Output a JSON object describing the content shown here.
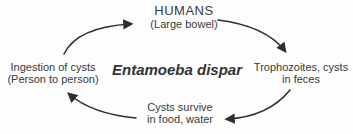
{
  "diagram": {
    "title": "Entamoeba dispar",
    "nodes": {
      "humans": {
        "line1": "HUMANS",
        "line2": "(Large bowel)"
      },
      "trophozoites": {
        "line1": "Trophozoites, cysts",
        "line2": "in feces"
      },
      "cysts_survive": {
        "line1": "Cysts survive",
        "line2": "in food, water"
      },
      "ingestion": {
        "line1": "Ingestion of cysts",
        "line2": "(Person to person)"
      }
    },
    "arrows": [
      {
        "name": "ingestion-to-humans",
        "direction": "up-right"
      },
      {
        "name": "humans-to-trophozoites",
        "direction": "down-right"
      },
      {
        "name": "trophozoites-to-cysts",
        "direction": "down-left"
      },
      {
        "name": "cysts-to-ingestion",
        "direction": "up-left"
      }
    ],
    "colors": {
      "text": "#3a3a3a",
      "arrow": "#2f2f2f",
      "background": "#fdfdfd"
    }
  }
}
